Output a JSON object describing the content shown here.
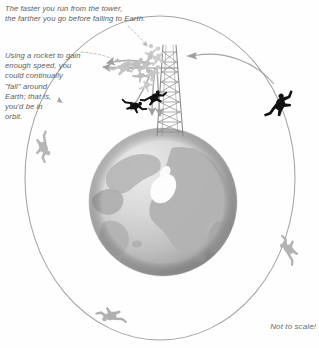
{
  "figure": {
    "title_semantic": "newtons-cannonball-orbit-diagram",
    "annotations": {
      "top_caption": "The faster you run from the tower,\nthe farther you go before falling to Earth.",
      "left_caption": "Using a rocket to gain\nenough speed, you\ncould continually\n\"fall\" around\nEarth; that is,\nyou'd be in\norbit.",
      "scale_note": "Not to scale!"
    },
    "labels": {
      "globe": "Earth",
      "tower": "tower",
      "orbit_path": "orbit ellipse",
      "polar_cap": "polar ice cap"
    },
    "colors": {
      "background": "#fefefe",
      "text": "#5d5d5d",
      "orbit_line": "#9a9a9a",
      "globe_ocean_light": "#e2e2e2",
      "globe_ocean_mid": "#c9c9c9",
      "globe_ocean_dark": "#9e9e9e",
      "globe_land": "#b4b4b4",
      "globe_land_dark": "#a0a0a0",
      "ice_cap": "#fdfdfd",
      "tower_struct": "#8d8d8d",
      "figure_dark": "#111111",
      "figure_light": "#c0c0c0",
      "arrow_gray": "#a8a8a8",
      "leader_dash": "#b0b0b0"
    },
    "geometry": {
      "globe_center_x": 163,
      "globe_center_y": 202,
      "globe_radius": 74,
      "orbit_center_x": 160,
      "orbit_center_y": 178,
      "orbit_rx": 135,
      "orbit_ry": 162,
      "tower_base_x": 168,
      "tower_base_y": 140,
      "tower_top_y": 44
    },
    "trajectories": [
      {
        "name": "short-fall",
        "label": "shortest trajectory"
      },
      {
        "name": "medium-fall",
        "label": "medium trajectory"
      },
      {
        "name": "long-fall",
        "label": "long trajectory"
      },
      {
        "name": "orbital",
        "label": "orbital trajectory"
      }
    ],
    "figure_count_on_orbit": 4
  }
}
